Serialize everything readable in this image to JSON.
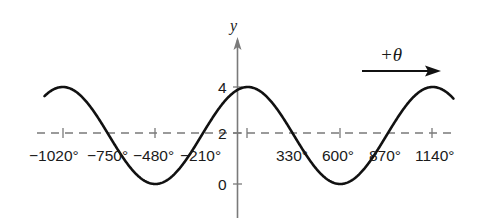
{
  "chart_data": {
    "type": "line",
    "title": "",
    "xlabel": "θ (degrees)",
    "ylabel": "y",
    "function": "y = 2 + 2cos((θ − 60°)/3)",
    "period_deg": 1080,
    "midline": 2,
    "amplitude": 2,
    "xlim": [
      -1127,
      1261
    ],
    "ylim": [
      0,
      4
    ],
    "grid": false,
    "legend": null,
    "x_tick_labels": [
      "−1020°",
      "−750°",
      "−480°",
      "−210°",
      "330°",
      "600°",
      "870°",
      "1140°"
    ],
    "x_tick_values": [
      -1020,
      -750,
      -480,
      -210,
      330,
      600,
      870,
      1140
    ],
    "x_tick_marks": [
      -1020,
      -480,
      60,
      600,
      1140
    ],
    "y_ticks": [
      0,
      2,
      4
    ],
    "y_tick_labels": [
      "0",
      "2",
      "4"
    ],
    "series": [
      {
        "name": "y(θ)",
        "x": [
          -1127,
          -1020,
          -750,
          -480,
          -210,
          60,
          330,
          600,
          870,
          1140,
          1261
        ],
        "values": [
          3.87,
          4,
          2,
          0,
          2,
          4,
          2,
          0,
          2,
          4,
          3.87
        ]
      }
    ],
    "reference_lines": [
      {
        "orientation": "horizontal",
        "y": 2,
        "style": "dashed",
        "color": "#7a7a7a"
      }
    ],
    "annotations": [
      {
        "text": "+θ",
        "type": "arrow",
        "direction": "right"
      }
    ]
  },
  "labels": {
    "y_axis": "y",
    "arrow": "+θ",
    "y4": "4",
    "y2": "2",
    "y0": "0",
    "x": [
      "−1020°",
      "−750°",
      "−480°",
      "−210°",
      "330°",
      "600°",
      "870°",
      "1140°"
    ]
  },
  "colors": {
    "curve": "#111111",
    "axis": "#7a7a7a",
    "dash": "#7a7a7a",
    "text": "#1a1a1a"
  }
}
